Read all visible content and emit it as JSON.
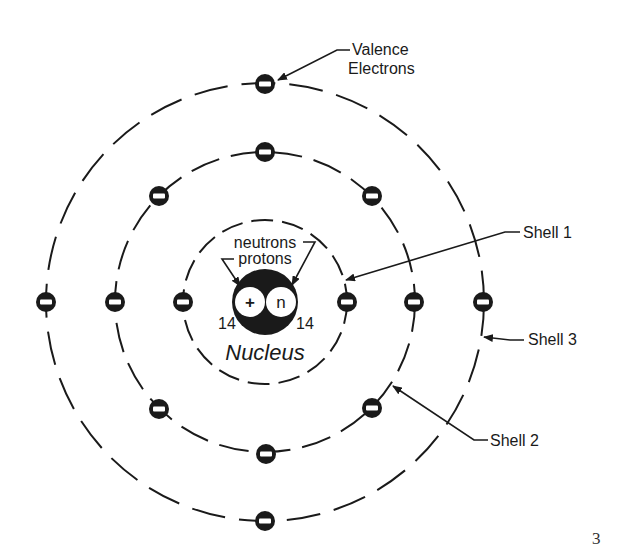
{
  "diagram": {
    "labels": {
      "valence_line1": "Valence",
      "valence_line2": "Electrons",
      "neutrons": "neutrons",
      "protons": "protons",
      "proton_symbol": "+",
      "neutron_symbol": "n",
      "proton_count": "14",
      "neutron_count": "14",
      "nucleus": "Nucleus",
      "shell1": "Shell 1",
      "shell2": "Shell 2",
      "shell3": "Shell 3",
      "electron_symbol": "−"
    },
    "center": [
      265,
      302
    ],
    "shells": [
      {
        "name": "Shell 1",
        "radius": 82,
        "electrons": 2
      },
      {
        "name": "Shell 2",
        "radius": 150,
        "electrons": 8
      },
      {
        "name": "Shell 3",
        "radius": 219,
        "electrons": 4
      }
    ],
    "colors": {
      "ink": "#1a1a1a",
      "background": "#ffffff"
    }
  },
  "page": {
    "number": "3"
  }
}
